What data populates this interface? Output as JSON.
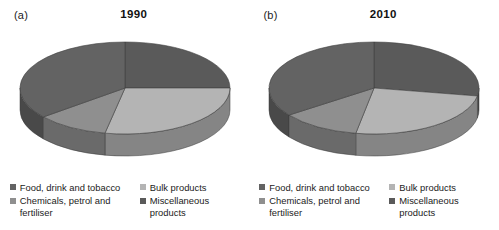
{
  "figure": {
    "background": "#ffffff",
    "panels": [
      {
        "tag": "(a)",
        "title": "1990",
        "chart_index": 0
      },
      {
        "tag": "(b)",
        "title": "2010",
        "chart_index": 1
      }
    ]
  },
  "palette": {
    "food_drink_tobacco": "#636363",
    "bulk_products": "#b4b4b4",
    "chemicals_petrol_fertiliser": "#8f8f8f",
    "miscellaneous_products": "#5a5a5a",
    "side_food": "#4c4c4c",
    "side_bulk": "#8d8d8d",
    "side_chemicals": "#6e6e6e",
    "side_misc": "#464646",
    "edge": "#3a3a3a"
  },
  "legend": {
    "items": [
      {
        "label": "Food, drink and tobacco",
        "color_key": "food_drink_tobacco",
        "marker": "square-marker"
      },
      {
        "label": "Bulk products",
        "color_key": "bulk_products",
        "marker": "square-marker"
      },
      {
        "label": "Chemicals, petrol and fertiliser",
        "color_key": "chemicals_petrol_fertiliser",
        "marker": "square-marker"
      },
      {
        "label": "Miscellaneous products",
        "color_key": "miscellaneous_products",
        "marker": "square-marker"
      }
    ]
  },
  "chart_data": [
    {
      "type": "pie",
      "title": "1990",
      "panel_tag": "(a)",
      "three_d": true,
      "start_angle_deg": 0,
      "direction": "clockwise",
      "labels": [
        "Miscellaneous products",
        "Bulk products",
        "Chemicals, petrol and fertiliser",
        "Food, drink and tobacco"
      ],
      "values": [
        25,
        28,
        11,
        36
      ],
      "unit": "percent",
      "angles_deg": [
        90,
        101,
        40,
        129
      ],
      "colors": [
        "#5a5a5a",
        "#b4b4b4",
        "#8f8f8f",
        "#636363"
      ],
      "legend_position": "bottom",
      "grid": false,
      "xlabel": "",
      "ylabel": ""
    },
    {
      "type": "pie",
      "title": "2010",
      "panel_tag": "(b)",
      "three_d": true,
      "start_angle_deg": 0,
      "direction": "clockwise",
      "labels": [
        "Miscellaneous products",
        "Bulk products",
        "Chemicals, petrol and fertiliser",
        "Food, drink and tobacco"
      ],
      "values": [
        28,
        25,
        12,
        35
      ],
      "unit": "percent",
      "angles_deg": [
        100,
        90,
        44,
        126
      ],
      "colors": [
        "#5a5a5a",
        "#b4b4b4",
        "#8f8f8f",
        "#636363"
      ],
      "legend_position": "bottom",
      "grid": false,
      "xlabel": "",
      "ylabel": ""
    }
  ]
}
